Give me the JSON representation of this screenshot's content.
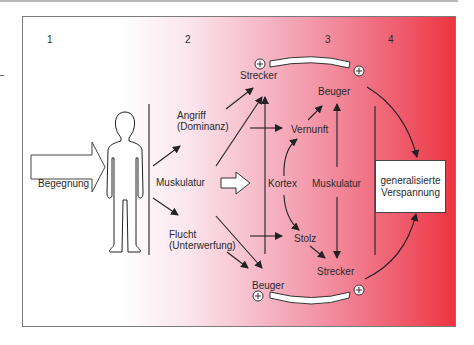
{
  "diagram": {
    "column_numbers": [
      "1",
      "2",
      "3",
      "4"
    ],
    "input_arrow_label": "Begegnung",
    "column2": {
      "attack": [
        "Angriff",
        "(Dominanz)"
      ],
      "center": "Muskulatur",
      "flight": [
        "Flucht",
        "(Unterwerfung)"
      ]
    },
    "column3": {
      "top_extensor": "Strecker",
      "top_flexor": "Beuger",
      "reason": "Vernunft",
      "cortex": "Kortex",
      "musculature": "Muskulatur",
      "pride": "Stolz",
      "bottom_flexor": "Beuger",
      "bottom_extensor": "Strecker",
      "plus_sign": "+"
    },
    "result_box": [
      "generalisierte",
      "Verspannung"
    ],
    "colors": {
      "gradient_start": "#ffffff",
      "gradient_end": "#ee3440",
      "stroke": "#222222"
    }
  }
}
